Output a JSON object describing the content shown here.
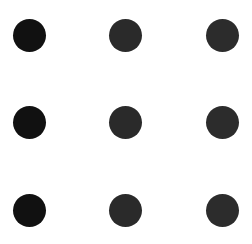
{
  "canvas": {
    "width": 252,
    "height": 244,
    "background": "#ffffff"
  },
  "grid": {
    "rows": 3,
    "cols": 3,
    "dot_diameter": 33,
    "column_centers_x": [
      29.5,
      125.5,
      222.5
    ],
    "row_centers_y": [
      35.5,
      122.5,
      210
    ],
    "dots": [
      {
        "row": 0,
        "col": 0,
        "color": "#111111"
      },
      {
        "row": 0,
        "col": 1,
        "color": "#2a2a2a"
      },
      {
        "row": 0,
        "col": 2,
        "color": "#2c2c2c"
      },
      {
        "row": 1,
        "col": 0,
        "color": "#111111"
      },
      {
        "row": 1,
        "col": 1,
        "color": "#2a2a2a"
      },
      {
        "row": 1,
        "col": 2,
        "color": "#2c2c2c"
      },
      {
        "row": 2,
        "col": 0,
        "color": "#111111"
      },
      {
        "row": 2,
        "col": 1,
        "color": "#2a2a2a"
      },
      {
        "row": 2,
        "col": 2,
        "color": "#2c2c2c"
      }
    ]
  }
}
